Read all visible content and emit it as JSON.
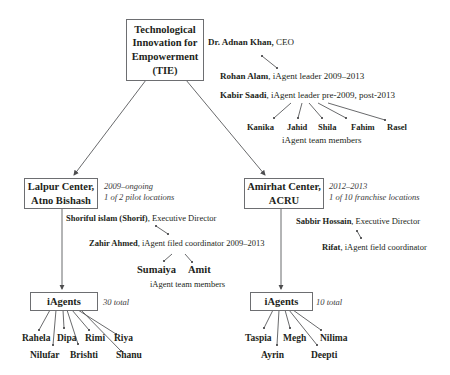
{
  "root": {
    "label": "Technological Innovation for Empowerment (TIE)",
    "lines": [
      "Technological",
      "Innovation for",
      "Empowerment",
      "(TIE)"
    ]
  },
  "tie_people": {
    "ceo": {
      "name": "Dr. Adnan Khan,",
      "role": " CEO"
    },
    "leader1": {
      "name": "Rohan Alam",
      "role": ", iAgent leader 2009–2013"
    },
    "leader2": {
      "name": "Kabir Saadi",
      "role": ", iAgent leader pre-2009, post-2013"
    },
    "team": [
      "Kanika",
      "Jahid",
      "Shila",
      "Fahim",
      "Rasel"
    ],
    "team_label": "iAgent team members"
  },
  "lalpur": {
    "lines": [
      "Lalpur Center,",
      "Atno Bishash"
    ],
    "period": "2009–ongoing",
    "note": "1 of 2 pilot locations",
    "director": {
      "name": "Shoriful islam (Shorif)",
      "role": ", Executive Director"
    },
    "coordinator": {
      "name": "Zahir Ahmed",
      "role": ", iAgent filed coordinator 2009–2013"
    },
    "team": [
      "Sumaiya",
      "Amit"
    ],
    "team_label": "iAgent team members",
    "iagents": {
      "label": "iAgents",
      "total": "30 total",
      "members": [
        "Rahela",
        "Dipa",
        "Rimi",
        "Riya",
        "Nilufar",
        "Brishti",
        "Shanu"
      ]
    }
  },
  "amirhat": {
    "lines": [
      "Amirhat Center,",
      "ACRU"
    ],
    "period": "2012–2013",
    "note": "1 of 10 franchise locations",
    "director": {
      "name": "Sabbir Hossain",
      "role": ", Executive Director"
    },
    "coordinator": {
      "name": "Rifat",
      "role": ", iAgent field coordinator"
    },
    "iagents": {
      "label": "iAgents",
      "total": "10 total",
      "members": [
        "Taspia",
        "Megh",
        "Nilima",
        "Ayrin",
        "Deepti"
      ]
    }
  }
}
